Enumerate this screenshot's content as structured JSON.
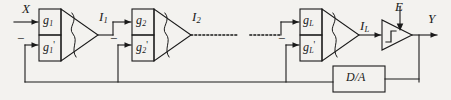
{
  "figure": {
    "type": "block-diagram",
    "background_color": "#f3f2ef",
    "line_color": "#1a1a1a"
  },
  "signals": {
    "input_x": "X",
    "output_y": "Y",
    "error_e": "E",
    "stage1_current": "I",
    "stage1_current_sub": "1",
    "stage2_current": "I",
    "stage2_current_sub": "2",
    "stageL_current": "I",
    "stageL_current_sub": "L"
  },
  "stages": [
    {
      "name": "stage-1",
      "gain_top": "g",
      "gain_top_sub": "1",
      "gain_bottom": "g",
      "gain_bottom_sub": "1",
      "gain_bottom_prime": "'",
      "minus_sign": "−",
      "output_label": "I",
      "output_sub": "1"
    },
    {
      "name": "stage-2",
      "gain_top": "g",
      "gain_top_sub": "2",
      "gain_bottom": "g",
      "gain_bottom_sub": "2",
      "gain_bottom_prime": "'",
      "minus_sign": "−",
      "output_label": "I",
      "output_sub": "2"
    },
    {
      "name": "stage-L",
      "gain_top": "g",
      "gain_top_sub": "L",
      "gain_bottom": "g",
      "gain_bottom_sub": "L",
      "gain_bottom_prime": "'",
      "minus_sign": "−",
      "output_label": "I",
      "output_sub": "L"
    }
  ],
  "blocks": {
    "da_converter": "D/A",
    "comparator": "comparator-with-step-symbol"
  },
  "continuation": {
    "ellipsis": "dotted-line-break"
  }
}
